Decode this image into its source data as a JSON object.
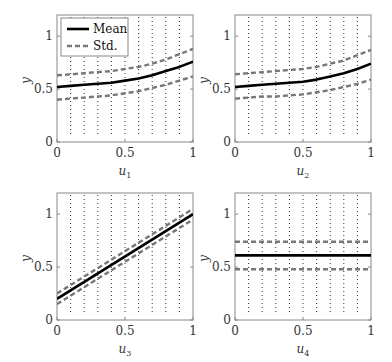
{
  "chart_data": [
    {
      "type": "line",
      "title": "",
      "xlabel": "u1",
      "ylabel": "y",
      "xlim": [
        0,
        1
      ],
      "ylim": [
        0,
        1.2
      ],
      "xticks": [
        "0",
        "0.5",
        "1"
      ],
      "yticks": [
        "0",
        "0.5",
        "1"
      ],
      "grid": "dotted vertical lines at x = 0.1 ... 0.9",
      "legend": {
        "position": "upper left",
        "entries": [
          "Mean",
          "Std."
        ]
      },
      "x": [
        0,
        0.1,
        0.2,
        0.3,
        0.4,
        0.5,
        0.6,
        0.7,
        0.8,
        0.9,
        1.0
      ],
      "series": [
        {
          "name": "Mean",
          "style": "solid",
          "values": [
            0.52,
            0.53,
            0.54,
            0.55,
            0.56,
            0.58,
            0.6,
            0.63,
            0.67,
            0.71,
            0.76
          ]
        },
        {
          "name": "Std. upper",
          "style": "dashed",
          "values": [
            0.63,
            0.64,
            0.65,
            0.66,
            0.67,
            0.69,
            0.71,
            0.74,
            0.78,
            0.83,
            0.88
          ]
        },
        {
          "name": "Std. lower",
          "style": "dashed",
          "values": [
            0.4,
            0.41,
            0.42,
            0.43,
            0.44,
            0.46,
            0.48,
            0.51,
            0.54,
            0.58,
            0.62
          ]
        }
      ]
    },
    {
      "type": "line",
      "title": "",
      "xlabel": "u2",
      "ylabel": "y",
      "xlim": [
        0,
        1
      ],
      "ylim": [
        0,
        1.2
      ],
      "xticks": [
        "0",
        "0.5",
        "1"
      ],
      "yticks": [
        "0",
        "0.5",
        "1"
      ],
      "grid": "dotted vertical lines at x = 0.1 ... 0.9",
      "x": [
        0,
        0.1,
        0.2,
        0.3,
        0.4,
        0.5,
        0.6,
        0.7,
        0.8,
        0.9,
        1.0
      ],
      "series": [
        {
          "name": "Mean",
          "style": "solid",
          "values": [
            0.52,
            0.53,
            0.54,
            0.55,
            0.56,
            0.57,
            0.59,
            0.62,
            0.65,
            0.69,
            0.74
          ]
        },
        {
          "name": "Std. upper",
          "style": "dashed",
          "values": [
            0.64,
            0.65,
            0.66,
            0.67,
            0.68,
            0.69,
            0.71,
            0.74,
            0.77,
            0.82,
            0.87
          ]
        },
        {
          "name": "Std. lower",
          "style": "dashed",
          "values": [
            0.41,
            0.42,
            0.43,
            0.43,
            0.44,
            0.45,
            0.47,
            0.49,
            0.52,
            0.55,
            0.59
          ]
        }
      ]
    },
    {
      "type": "line",
      "title": "",
      "xlabel": "u3",
      "ylabel": "y",
      "xlim": [
        0,
        1
      ],
      "ylim": [
        0,
        1.2
      ],
      "xticks": [
        "0",
        "0.5",
        "1"
      ],
      "yticks": [
        "0",
        "0.5",
        "1"
      ],
      "grid": "dotted vertical lines at x = 0.1 ... 0.9",
      "x": [
        0,
        1.0
      ],
      "series": [
        {
          "name": "Mean",
          "style": "solid",
          "values": [
            0.2,
            1.0
          ]
        },
        {
          "name": "Std. upper",
          "style": "dashed",
          "values": [
            0.25,
            1.05
          ]
        },
        {
          "name": "Std. lower",
          "style": "dashed",
          "values": [
            0.15,
            0.95
          ]
        }
      ]
    },
    {
      "type": "line",
      "title": "",
      "xlabel": "u4",
      "ylabel": "y",
      "xlim": [
        0,
        1
      ],
      "ylim": [
        0,
        1.2
      ],
      "xticks": [
        "0",
        "0.5",
        "1"
      ],
      "yticks": [
        "0",
        "0.5",
        "1"
      ],
      "grid": "dotted vertical lines at x = 0.1 ... 0.9",
      "x": [
        0,
        1.0
      ],
      "series": [
        {
          "name": "Mean",
          "style": "solid",
          "values": [
            0.61,
            0.61
          ]
        },
        {
          "name": "Std. upper",
          "style": "dashed",
          "values": [
            0.74,
            0.74
          ]
        },
        {
          "name": "Std. lower",
          "style": "dashed",
          "values": [
            0.48,
            0.48
          ]
        }
      ]
    }
  ],
  "legend": {
    "mean_label": "Mean",
    "std_label": "Std."
  },
  "axis": {
    "y_label": "y",
    "x_var": "u",
    "ticks_x": [
      "0",
      "0.5",
      "1"
    ],
    "ticks_y": [
      "0",
      "0.5",
      "1"
    ]
  },
  "colors": {
    "mean": "#000000",
    "std": "#777777",
    "grid": "#444444",
    "frame": "#888888"
  }
}
